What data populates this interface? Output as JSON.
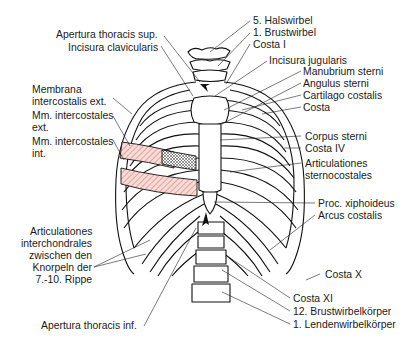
{
  "figure": {
    "colors": {
      "line": "#111111",
      "hatch_internal": "#d9706a",
      "hatch_fill": "#f6dcd8",
      "membrane_hatch": "#333333",
      "background": "#ffffff"
    }
  },
  "labels": {
    "left": [
      {
        "id": "apertura-sup",
        "text": "Apertura thoracis sup."
      },
      {
        "id": "incisura-clav",
        "text": "Incisura clavicularis"
      },
      {
        "id": "membrana-1",
        "text": "Membrana"
      },
      {
        "id": "membrana-2",
        "text": "intercostalis ext."
      },
      {
        "id": "mm-ext-1",
        "text": "Mm. intercostales"
      },
      {
        "id": "mm-ext-2",
        "text": "ext."
      },
      {
        "id": "mm-int-1",
        "text": "Mm. intercostales"
      },
      {
        "id": "mm-int-2",
        "text": "int."
      },
      {
        "id": "artic-inter-1",
        "text": "Articulationes"
      },
      {
        "id": "artic-inter-2",
        "text": "interchondrales"
      },
      {
        "id": "artic-inter-3",
        "text": "zwischen den"
      },
      {
        "id": "artic-inter-4",
        "text": "Knorpeln der"
      },
      {
        "id": "artic-inter-5",
        "text": "7.-10. Rippe"
      },
      {
        "id": "apertura-inf",
        "text": "Apertura thoracis inf."
      }
    ],
    "right": [
      {
        "id": "halswirbel",
        "text": "5. Halswirbel"
      },
      {
        "id": "brustwirbel",
        "text": "1. Brustwirbel"
      },
      {
        "id": "costa-1",
        "text": "Costa I"
      },
      {
        "id": "incisura-jug",
        "text": "Incisura jugularis"
      },
      {
        "id": "manubrium",
        "text": "Manubrium sterni"
      },
      {
        "id": "angulus",
        "text": "Angulus sterni"
      },
      {
        "id": "cartilago",
        "text": "Cartilago costalis"
      },
      {
        "id": "costa",
        "text": "Costa"
      },
      {
        "id": "corpus",
        "text": "Corpus sterni"
      },
      {
        "id": "costa-4",
        "text": "Costa IV"
      },
      {
        "id": "artic-sterno-1",
        "text": "Articulationes"
      },
      {
        "id": "artic-sterno-2",
        "text": "sternocostales"
      },
      {
        "id": "proc-xiph",
        "text": "Proc. xiphoideus"
      },
      {
        "id": "arcus",
        "text": "Arcus costalis"
      },
      {
        "id": "costa-10",
        "text": "Costa X"
      },
      {
        "id": "costa-11",
        "text": "Costa XI"
      },
      {
        "id": "brustwirbelkoerper",
        "text": "12. Brustwirbelkörper"
      },
      {
        "id": "lendenwirbelkoerper",
        "text": "1. Lendenwirbelkörper"
      }
    ]
  }
}
